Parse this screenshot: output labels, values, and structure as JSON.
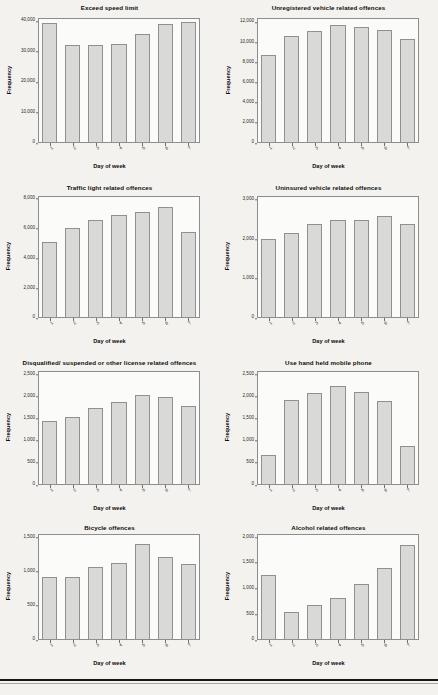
{
  "page": {
    "x_axis_label": "Day of week",
    "y_axis_label": "Frequency",
    "categories": [
      "1",
      "2",
      "3",
      "4",
      "5",
      "6",
      "7"
    ],
    "bar_fill": "#d9d9d7",
    "bar_border": "#909090",
    "background": "#f3f2ef"
  },
  "chart_data": [
    {
      "type": "bar",
      "title": "Exceed speed limit",
      "xlabel": "Day of week",
      "ylabel": "Frequency",
      "categories": [
        "1",
        "2",
        "3",
        "4",
        "5",
        "6",
        "7"
      ],
      "values": [
        39500,
        32300,
        32100,
        32400,
        35600,
        38900,
        39800
      ],
      "ylim": [
        0,
        41000
      ],
      "yticks": [
        0,
        10000,
        20000,
        30000,
        40000
      ],
      "ytick_labels": [
        "0",
        "10,000",
        "20,000",
        "30,000",
        "40,000"
      ],
      "grid": false,
      "legend": false
    },
    {
      "type": "bar",
      "title": "Unregistered vehicle related offences",
      "xlabel": "Day of week",
      "ylabel": "Frequency",
      "categories": [
        "1",
        "2",
        "3",
        "4",
        "5",
        "6",
        "7"
      ],
      "values": [
        8700,
        10600,
        11100,
        11750,
        11500,
        11250,
        10300
      ],
      "ylim": [
        0,
        12400
      ],
      "yticks": [
        0,
        2000,
        4000,
        6000,
        8000,
        10000,
        12000
      ],
      "ytick_labels": [
        "0",
        "2,000",
        "4,000",
        "6,000",
        "8,000",
        "10,000",
        "12,000"
      ],
      "grid": false,
      "legend": false
    },
    {
      "type": "bar",
      "title": "Traffic light related offences",
      "xlabel": "Day of week",
      "ylabel": "Frequency",
      "categories": [
        "1",
        "2",
        "3",
        "4",
        "5",
        "6",
        "7"
      ],
      "values": [
        5100,
        6050,
        6600,
        6950,
        7150,
        7450,
        5800
      ],
      "ylim": [
        0,
        8200
      ],
      "yticks": [
        0,
        2000,
        4000,
        6000,
        8000
      ],
      "ytick_labels": [
        "0",
        "2,000",
        "4,000",
        "6,000",
        "8,000"
      ],
      "grid": false,
      "legend": false
    },
    {
      "type": "bar",
      "title": "Uninsured vehicle related offences",
      "xlabel": "Day of week",
      "ylabel": "Frequency",
      "categories": [
        "1",
        "2",
        "3",
        "4",
        "5",
        "6",
        "7"
      ],
      "values": [
        2020,
        2150,
        2400,
        2480,
        2500,
        2580,
        2400
      ],
      "ylim": [
        0,
        3100
      ],
      "yticks": [
        0,
        1000,
        2000,
        3000
      ],
      "ytick_labels": [
        "0",
        "1,000",
        "2,000",
        "3,000"
      ],
      "grid": false,
      "legend": false
    },
    {
      "type": "bar",
      "title": "Disqualified/ suspended or other license related offences",
      "xlabel": "Day of week",
      "ylabel": "Frequency",
      "categories": [
        "1",
        "2",
        "3",
        "4",
        "5",
        "6",
        "7"
      ],
      "values": [
        1455,
        1545,
        1740,
        1890,
        2040,
        1995,
        1790
      ],
      "ylim": [
        0,
        2580
      ],
      "yticks": [
        0,
        500,
        1000,
        1500,
        2000,
        2500
      ],
      "ytick_labels": [
        "0",
        "500",
        "1,000",
        "1,500",
        "2,000",
        "2,500"
      ],
      "grid": false,
      "legend": false
    },
    {
      "type": "bar",
      "title": "Use hand held mobile phone",
      "xlabel": "Day of week",
      "ylabel": "Frequency",
      "categories": [
        "1",
        "2",
        "3",
        "4",
        "5",
        "6",
        "7"
      ],
      "values": [
        680,
        1930,
        2080,
        2245,
        2100,
        1900,
        880
      ],
      "ylim": [
        0,
        2580
      ],
      "yticks": [
        0,
        500,
        1000,
        1500,
        2000,
        2500
      ],
      "ytick_labels": [
        "0",
        "500",
        "1,000",
        "1,500",
        "2,000",
        "2,500"
      ],
      "grid": false,
      "legend": false
    },
    {
      "type": "bar",
      "title": "Bicycle offences",
      "xlabel": "Day of week",
      "ylabel": "Frequency",
      "categories": [
        "1",
        "2",
        "3",
        "4",
        "5",
        "6",
        "7"
      ],
      "values": [
        915,
        925,
        1070,
        1125,
        1400,
        1220,
        1110
      ],
      "ylim": [
        0,
        1550
      ],
      "yticks": [
        0,
        500,
        1000,
        1500
      ],
      "ytick_labels": [
        "0",
        "500",
        "1,000",
        "1,500"
      ],
      "grid": false,
      "legend": false
    },
    {
      "type": "bar",
      "title": "Alcohol related offences",
      "xlabel": "Day of week",
      "ylabel": "Frequency",
      "categories": [
        "1",
        "2",
        "3",
        "4",
        "5",
        "6",
        "7"
      ],
      "values": [
        1260,
        550,
        690,
        820,
        1090,
        1390,
        1850
      ],
      "ylim": [
        0,
        2060
      ],
      "yticks": [
        0,
        500,
        1000,
        1500,
        2000
      ],
      "ytick_labels": [
        "0",
        "500",
        "1,000",
        "1,500",
        "2,000"
      ],
      "grid": false,
      "legend": false
    }
  ]
}
